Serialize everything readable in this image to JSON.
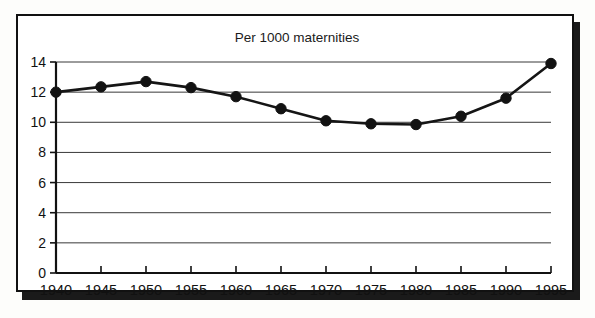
{
  "chart_data": {
    "type": "line",
    "title": "Per 1000 maternities",
    "xlabel": "",
    "ylabel": "",
    "x": [
      1940,
      1945,
      1950,
      1955,
      1960,
      1965,
      1970,
      1975,
      1980,
      1985,
      1990,
      1995
    ],
    "categories": [
      "1940",
      "1945",
      "1950",
      "1955",
      "1960",
      "1965",
      "1970",
      "1975",
      "1980",
      "1985",
      "1990",
      "1995"
    ],
    "values": [
      12.0,
      12.35,
      12.7,
      12.3,
      11.7,
      10.9,
      10.1,
      9.9,
      9.85,
      10.4,
      11.6,
      13.9
    ],
    "series": [
      {
        "name": "Per 1000 maternities",
        "values": [
          12.0,
          12.35,
          12.7,
          12.3,
          11.7,
          10.9,
          10.1,
          9.9,
          9.85,
          10.4,
          11.6,
          13.9
        ]
      }
    ],
    "ylim": [
      0,
      14
    ],
    "xlim": [
      1940,
      1995
    ],
    "yticks": [
      0,
      2,
      4,
      6,
      8,
      10,
      12,
      14
    ],
    "ytick_labels": [
      "0",
      "2",
      "4",
      "6",
      "8",
      "10",
      "12",
      "14"
    ],
    "xticks": [
      1940,
      1945,
      1950,
      1955,
      1960,
      1965,
      1970,
      1975,
      1980,
      1985,
      1990,
      1995
    ],
    "xtick_labels": [
      "1940",
      "1945",
      "1950",
      "1955",
      "1960",
      "1965",
      "1970",
      "1975",
      "1980",
      "1985",
      "1990",
      "1995"
    ],
    "grid": "horizontal",
    "legend": "none",
    "marker": "filled-circle",
    "line_color": "#151515",
    "marker_color": "#121212",
    "grid_color": "#222222",
    "axis_color": "#111111",
    "background_color": "#ffffff",
    "frame_color": "#111111",
    "annotations": []
  }
}
